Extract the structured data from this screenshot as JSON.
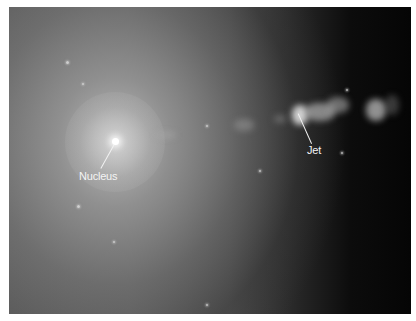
{
  "image": {
    "subject": "galaxy with jet",
    "labels": [
      {
        "id": "nucleus",
        "text": "Nucleus"
      },
      {
        "id": "jet",
        "text": "Jet"
      }
    ]
  },
  "colors": {
    "background": "#ffffff",
    "label_text": "#f4f4f4",
    "nucleus_glow": "#c0c0c0",
    "dark_region": "#050505"
  }
}
